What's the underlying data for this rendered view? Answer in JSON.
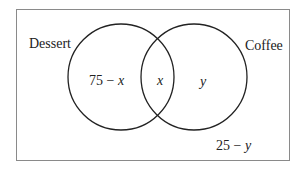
{
  "diagram": {
    "type": "venn",
    "sets": [
      {
        "name": "Dessert",
        "label": "Dessert"
      },
      {
        "name": "Coffee",
        "label": "Coffee"
      }
    ],
    "regions": {
      "dessert_only": {
        "prefix": "75 − ",
        "var": "x"
      },
      "both": {
        "var": "x"
      },
      "coffee_only": {
        "var": "y"
      },
      "neither": {
        "prefix": "25 − ",
        "var": "y"
      }
    },
    "colors": {
      "stroke": "#222222",
      "border": "#888888",
      "background": "#ffffff"
    }
  }
}
